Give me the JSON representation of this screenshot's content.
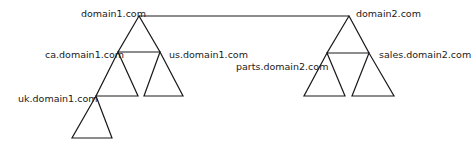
{
  "diagram": {
    "type": "active-directory-forest",
    "trust_link": {
      "from": "domain1.com",
      "to": "domain2.com"
    },
    "trees": [
      {
        "root": "domain1.com",
        "children": [
          {
            "name": "ca.domain1.com",
            "children": [
              {
                "name": "uk.domain1.com"
              }
            ]
          },
          {
            "name": "us.domain1.com"
          }
        ]
      },
      {
        "root": "domain2.com",
        "children": [
          {
            "name": "parts.domain2.com"
          },
          {
            "name": "sales.domain2.com"
          }
        ]
      }
    ]
  },
  "labels": {
    "domain1": "domain1.com",
    "ca": "ca.domain1.com",
    "us": "us.domain1.com",
    "uk": "uk.domain1.com",
    "domain2": "domain2.com",
    "parts": "parts.domain2.com",
    "sales": "sales.domain2.com"
  },
  "colors": {
    "line": "#1a1a1a",
    "background": "#ffffff"
  }
}
